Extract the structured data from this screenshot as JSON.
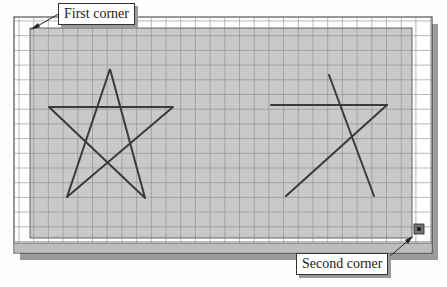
{
  "figure": {
    "colors": {
      "background": "#fdfdfd",
      "frame_border": "#333333",
      "grid_area": "#ffffff",
      "selection_fill": "#c9c9c9",
      "grid_line": "#8a8a8a",
      "star_line": "#3a3a3a",
      "shadow": "#9a9a9a",
      "bottom_bar": "#bdbdbd"
    },
    "grid": {
      "spacing_px": 14.7
    }
  },
  "callouts": {
    "first_corner": {
      "label": "First corner"
    },
    "second_corner": {
      "label": "Second corner"
    }
  },
  "shapes": {
    "full_star": {
      "points": [
        [
          110,
          69
        ],
        [
          145,
          198
        ],
        [
          49,
          107
        ],
        [
          173,
          107
        ],
        [
          67,
          197
        ],
        [
          110,
          69
        ]
      ]
    },
    "partial_star": {
      "segments": [
        [
          [
            271,
            105
          ],
          [
            387,
            105
          ]
        ],
        [
          [
            329,
            75
          ],
          [
            374,
            196
          ]
        ],
        [
          [
            387,
            105
          ],
          [
            286,
            196
          ]
        ]
      ]
    }
  },
  "grip": {
    "name": "selection-grip",
    "x": 419,
    "y": 229
  }
}
